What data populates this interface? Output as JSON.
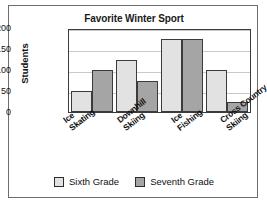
{
  "chart_data": {
    "type": "bar",
    "title": "Favorite Winter Sport",
    "xlabel": "",
    "ylabel": "Students",
    "ylim": [
      0,
      200
    ],
    "yticks": [
      0,
      50,
      100,
      150,
      200
    ],
    "grid": true,
    "legend_position": "bottom",
    "categories": [
      "Ice Skating",
      "Downhill Skiing",
      "Ice Fishing",
      "Cross Country Skiing"
    ],
    "category_lines": [
      [
        "Ice",
        "Skating"
      ],
      [
        "Downhill",
        "Skiing"
      ],
      [
        "Ice",
        "Fishing"
      ],
      [
        "Cross Country",
        "Skiing"
      ]
    ],
    "series": [
      {
        "name": "Sixth Grade",
        "color": "#e2e2e2",
        "values": [
          50,
          125,
          175,
          100
        ]
      },
      {
        "name": "Seventh Grade",
        "color": "#a5a5a5",
        "values": [
          100,
          75,
          175,
          25
        ]
      }
    ]
  },
  "legend": {
    "items": [
      {
        "label": "Sixth Grade",
        "color": "#e2e2e2"
      },
      {
        "label": "Seventh Grade",
        "color": "#a5a5a5"
      }
    ]
  },
  "colors": {
    "sixth_grade": "#e2e2e2",
    "seventh_grade": "#a5a5a5",
    "axis": "#3b3b3b",
    "grid": "#c9c9c9",
    "frame": "#6d6d6d"
  }
}
